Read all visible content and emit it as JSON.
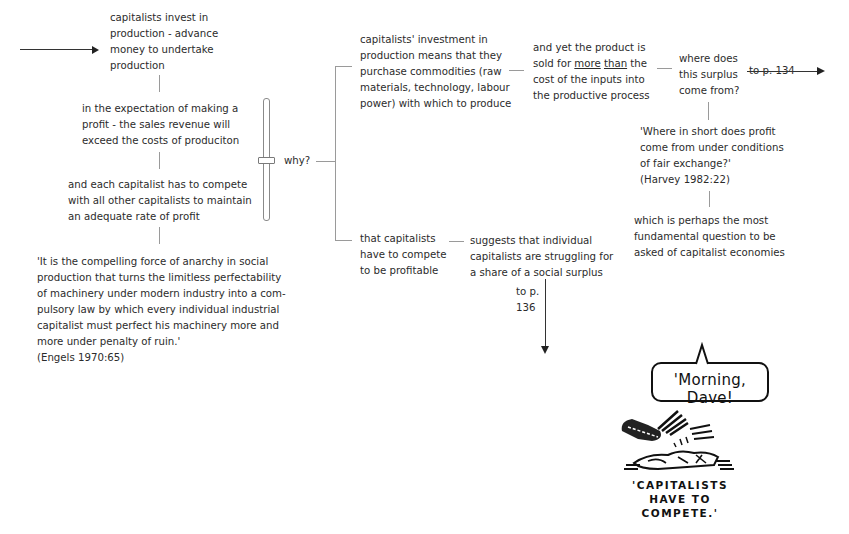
{
  "diagram": {
    "nodes": {
      "invest": "capitalists invest in\nproduction - advance\nmoney to undertake\nproduction",
      "expectation": "in the expectation of making a\nprofit - the sales revenue will\nexceed the costs of produciton",
      "compete": "and each capitalist has to compete\nwith all other capitalists to maintain\nan adequate rate of profit",
      "engels_quote": "'It is the compelling force of anarchy in social\nproduction that turns the limitless perfectability\nof machinery under modern industry into a com-\npulsory law by which every individual industrial\ncapitalist must perfect his machinery more and\nmore under penalty of ruin.'\n(Engels 1970:65)",
      "why": "why?",
      "purchase": "capitalists' investment in\nproduction means that they\npurchase commodities (raw\nmaterials, technology, labour\npower) with which to produce",
      "product_sold_pre": "and yet the product is\nsold for ",
      "product_sold_more": "more",
      "product_sold_than": "than",
      "product_sold_post": " the\ncost of the inputs into\nthe productive process",
      "surplus_question": "where does\nthis surplus\ncome from?",
      "to_p134": "to p. 134",
      "harvey_quote": "'Where in short does profit\ncome from under conditions\nof fair exchange?'\n(Harvey 1982:22)",
      "fundamental": "which is perhaps the most\nfundamental question to be\nasked of capitalist economies",
      "have_to_compete": "that capitalists\nhave to compete\nto be profitable",
      "struggling": "suggests that individual\ncapitalists are struggling for\na share of a social surplus",
      "to_p136": "to p.\n136"
    },
    "cartoon": {
      "speech": "'Morning, Dave!",
      "caption": "'CAPITALISTS\nHAVE TO\nCOMPETE.'"
    },
    "colors": {
      "text": "#2b2b2b",
      "connector": "#9a9a9a",
      "arrow": "#222222",
      "ink": "#111111"
    }
  }
}
